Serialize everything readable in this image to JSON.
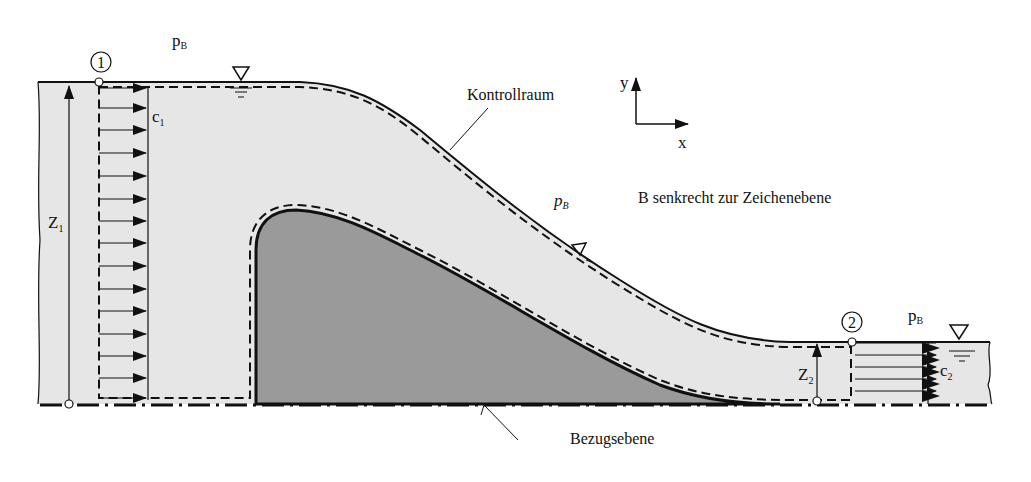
{
  "diagram": {
    "labels": {
      "pressure_top": "p",
      "pressure_sub": "B",
      "section1": "1",
      "section2": "2",
      "c1": "c",
      "c1_sub": "1",
      "c2": "c",
      "c2_sub": "2",
      "z1": "Z",
      "z1_sub": "1",
      "z2": "Z",
      "z2_sub": "2",
      "control_volume": "Kontrollraum",
      "axis_x": "x",
      "axis_y": "y",
      "note": "B senkrecht zur Zeichenebene",
      "reference_plane": "Bezugsebene"
    },
    "icons": [
      "water-level-triangle-icon",
      "coordinate-axes-icon",
      "section-marker-icon"
    ],
    "colors": {
      "water": "#e6e6e6",
      "weir": "#9a9a9a",
      "line": "#111111",
      "background": "#ffffff"
    }
  }
}
